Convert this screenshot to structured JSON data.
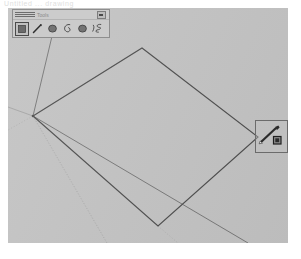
{
  "app": {
    "clipped_header_text": "Untitled  ... drawing",
    "background_color": "#ffffff"
  },
  "canvas": {
    "name": "drawing-canvas",
    "background_color": "#c3c3c3",
    "x": 8,
    "y": 8,
    "width": 280,
    "height": 235,
    "stroke_color": "#4a4a4a",
    "guide_color": "#9a9a9a",
    "geometry": {
      "polygon_label": "quadrilateral",
      "polygon_points": "25,108 134,40 250,129 150,218",
      "construction_lines": [
        {
          "name": "guide-line-upper-left",
          "x1": 25,
          "y1": 108,
          "x2": 44,
          "y2": 28
        },
        {
          "name": "guide-line-left-edge",
          "x1": 25,
          "y1": 108,
          "x2": 0,
          "y2": 99
        },
        {
          "name": "guide-line-lower-right",
          "x1": 25,
          "y1": 108,
          "x2": 238,
          "y2": 235
        }
      ],
      "dotted_lines": [
        {
          "name": "dotted-guide-vertical",
          "x1": 25,
          "y1": 108,
          "x2": 98,
          "y2": 235
        },
        {
          "name": "dotted-guide-left",
          "x1": 25,
          "y1": 108,
          "x2": 0,
          "y2": 120
        },
        {
          "name": "dotted-guide-bottom",
          "x1": 150,
          "y1": 218,
          "x2": 168,
          "y2": 235
        }
      ]
    }
  },
  "tool_palette": {
    "name": "tool-palette",
    "title": "Tools",
    "close_label": "Close",
    "selected_index": 0,
    "tools": [
      {
        "label": "Fill Rectangle",
        "icon": "filled-square-icon",
        "selected": true
      },
      {
        "label": "Line",
        "icon": "pencil-line-icon",
        "selected": false
      },
      {
        "label": "Filled Ellipse",
        "icon": "filled-circle-icon",
        "selected": false
      },
      {
        "label": "Outline Blob",
        "icon": "outline-teardrop-icon",
        "selected": false
      },
      {
        "label": "Filled Blob",
        "icon": "filled-circle-icon",
        "selected": false
      },
      {
        "label": "Freehand Curve",
        "icon": "squiggle-icon",
        "selected": false
      }
    ]
  },
  "cursor_box": {
    "name": "cursor-preview-box",
    "label": "Pencil tool cursor",
    "icon": "pencil-with-square-icon",
    "x": 255,
    "y": 120,
    "size": 33,
    "border_color": "#6b6b6b"
  }
}
